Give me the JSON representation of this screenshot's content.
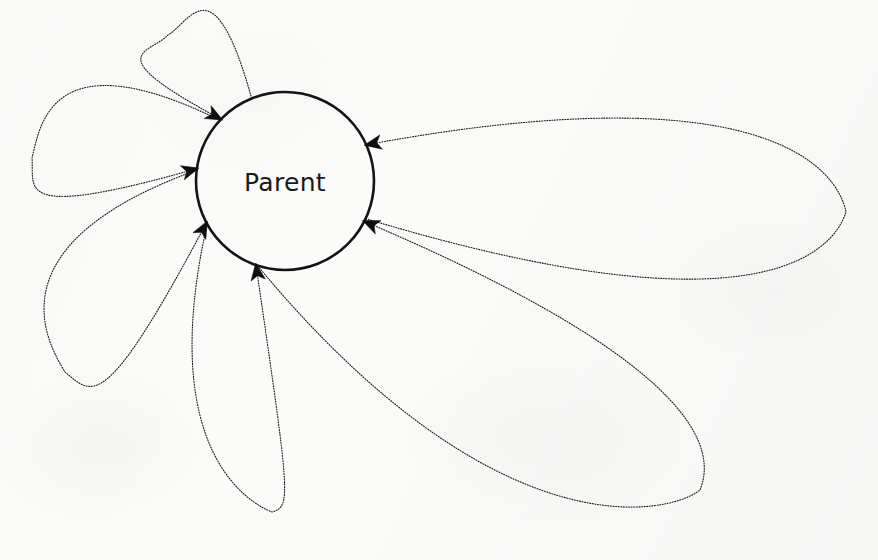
{
  "diagram": {
    "type": "state-transition-self-loop-diagram",
    "background_color": "#fbfbfa",
    "stroke_color": "#1a1a1a",
    "node": {
      "id": "parent",
      "label": "Parent",
      "shape": "circle",
      "cx": 285,
      "cy": 181,
      "r": 89,
      "stroke_color": "#141414",
      "stroke_width": 2.6,
      "fill": "none",
      "label_font_size": 25
    },
    "edge_style": {
      "line_style": "dotted",
      "stroke_width": 1.1,
      "dash_array": "1,1.6",
      "arrowhead": "solid-concave-triangle",
      "arrowhead_color": "#0d0d0d"
    },
    "self_loops": [
      {
        "name": "loop-top",
        "index": 1,
        "tip_x": 168,
        "tip_y": 35,
        "exit_angle_deg": 112,
        "arrow_angle_deg": 136,
        "size": "small"
      },
      {
        "name": "loop-left",
        "index": 2,
        "tip_x": 32,
        "tip_y": 158,
        "exit_angle_deg": 137,
        "arrow_angle_deg": 172,
        "size": "medium"
      },
      {
        "name": "loop-lower-left",
        "index": 3,
        "tip_x": 65,
        "tip_y": 372,
        "exit_angle_deg": 173,
        "arrow_angle_deg": 208,
        "size": "medium"
      },
      {
        "name": "loop-bottom",
        "index": 4,
        "tip_x": 272,
        "tip_y": 512,
        "exit_angle_deg": 209,
        "arrow_angle_deg": 251,
        "size": "narrow-long"
      },
      {
        "name": "loop-bottom-right",
        "index": 5,
        "tip_x": 700,
        "tip_y": 490,
        "exit_angle_deg": 252,
        "arrow_angle_deg": 333,
        "size": "large"
      },
      {
        "name": "loop-right",
        "index": 6,
        "tip_x": 846,
        "tip_y": 212,
        "exit_angle_deg": 335,
        "arrow_angle_deg": 24,
        "size": "large"
      }
    ],
    "loop_count": 6,
    "arrow_directions": "all edges point inward toward the Parent node"
  }
}
